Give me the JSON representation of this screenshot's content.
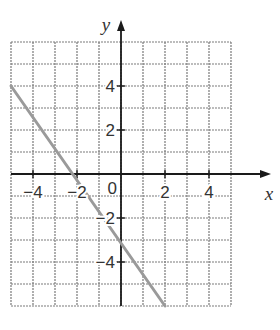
{
  "chart_data": {
    "type": "line",
    "title": "",
    "xlabel": "x",
    "ylabel": "y",
    "xlim": [
      -5,
      5
    ],
    "ylim": [
      -6,
      6
    ],
    "grid": true,
    "grid_step": 1,
    "x_ticks": [
      -4,
      -2,
      2,
      4
    ],
    "y_ticks": [
      4,
      2,
      -2,
      -4
    ],
    "x_tick_labels": [
      "−4",
      "−2",
      "2",
      "4"
    ],
    "y_tick_labels": [
      "4",
      "2",
      "−2",
      "−4"
    ],
    "origin_label": "0",
    "series": [
      {
        "name": "line",
        "color": "#9a9a9a",
        "points": [
          [
            -5,
            4
          ],
          [
            2,
            -6
          ]
        ]
      }
    ]
  }
}
